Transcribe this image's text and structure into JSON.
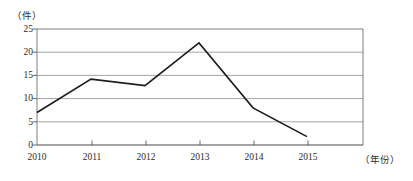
{
  "chart_data": {
    "type": "line",
    "title": "",
    "subtitle": "",
    "xlabel": "（年份）",
    "ylabel": "（件）",
    "categories": [
      "2010",
      "2011",
      "2012",
      "2013",
      "2014",
      "2015"
    ],
    "values": [
      7,
      14.2,
      12.8,
      22,
      8,
      1.8
    ],
    "series": [
      {
        "name": "",
        "values": [
          7,
          14.2,
          12.8,
          22,
          8,
          1.8
        ]
      }
    ],
    "x_tick_labels": [
      "2010",
      "2011",
      "2012",
      "2013",
      "2014",
      "2015"
    ],
    "y_tick_labels": [
      "0",
      "5",
      "10",
      "15",
      "20",
      "25"
    ],
    "y_ticks": [
      0,
      5,
      10,
      15,
      20,
      25
    ],
    "ylim": [
      0,
      25
    ],
    "grid": "horizontal",
    "legend": "none",
    "line_color": "#1c1c1c",
    "gridline_color": "#8e8e8e",
    "background_color": "#ffffff"
  },
  "axes": {
    "y_unit": "（件）",
    "x_unit": "（年份）"
  },
  "ticks": {
    "y": [
      {
        "label": "25",
        "value": 25
      },
      {
        "label": "20",
        "value": 20
      },
      {
        "label": "15",
        "value": 15
      },
      {
        "label": "10",
        "value": 10
      },
      {
        "label": "5",
        "value": 5
      },
      {
        "label": "0",
        "value": 0
      }
    ],
    "x": [
      {
        "label": "2010",
        "value": 7
      },
      {
        "label": "2011",
        "value": 14.2
      },
      {
        "label": "2012",
        "value": 12.8
      },
      {
        "label": "2013",
        "value": 22
      },
      {
        "label": "2014",
        "value": 8
      },
      {
        "label": "2015",
        "value": 1.8
      }
    ]
  }
}
